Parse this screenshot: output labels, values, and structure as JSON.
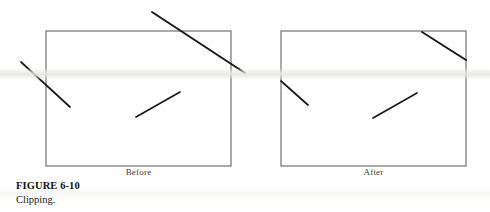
{
  "figure": {
    "caption_title": "FIGURE 6-10",
    "caption_text": "Clipping.",
    "width": 490,
    "height": 212,
    "background_color": "#ffffff",
    "ink_color": "#1a1a1a",
    "box_stroke_color": "#555555"
  },
  "panels": [
    {
      "id": "before",
      "label": "Before",
      "clip_rect": {
        "x": 46,
        "y": 31,
        "width": 185,
        "height": 135
      },
      "clipping_applied": false,
      "lines": [
        {
          "name": "long-diagonal-crossing-top-right",
          "x1": 152,
          "y1": 12,
          "x2": 245,
          "y2": 73,
          "stroke_width": 2.0,
          "note": "crosses top edge and right edge of rectangle"
        },
        {
          "name": "outside-left-diagonal",
          "x1": 21,
          "y1": 62,
          "x2": 70,
          "y2": 107,
          "stroke_width": 1.7,
          "note": "lies entirely outside the rectangle to the left"
        },
        {
          "name": "interior-diagonal",
          "x1": 136,
          "y1": 117,
          "x2": 180,
          "y2": 92,
          "stroke_width": 1.7,
          "note": "lies entirely inside the rectangle"
        }
      ]
    },
    {
      "id": "after",
      "label": "After",
      "clip_rect": {
        "x": 281,
        "y": 31,
        "width": 185,
        "height": 135
      },
      "clipping_applied": true,
      "lines": [
        {
          "name": "clipped-top-right-diagonal",
          "x1": 422,
          "y1": 32,
          "x2": 466,
          "y2": 60,
          "stroke_width": 2.0,
          "note": "remaining portion inside rectangle after clipping"
        },
        {
          "name": "clipped-left-diagonal",
          "x1": 281,
          "y1": 81,
          "x2": 308,
          "y2": 105,
          "stroke_width": 1.7,
          "note": "remaining portion inside rectangle after clipping"
        },
        {
          "name": "interior-diagonal",
          "x1": 373,
          "y1": 118,
          "x2": 417,
          "y2": 93,
          "stroke_width": 1.7,
          "note": "unchanged, fully inside rectangle"
        }
      ]
    }
  ]
}
